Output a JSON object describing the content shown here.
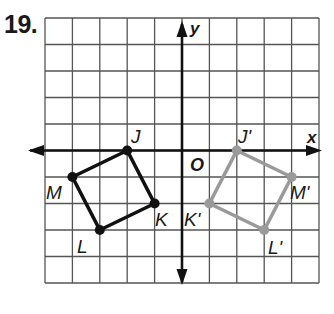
{
  "problem": {
    "number": "19."
  },
  "grid": {
    "cols": 10,
    "rows": 10,
    "x_range": [
      -5,
      5
    ],
    "y_range": [
      -5,
      5
    ],
    "origin_px": [
      182,
      150.5
    ],
    "cell_w": 27.4,
    "cell_h": 26.5,
    "left": 45,
    "top": 18,
    "grid_color": "#555555",
    "axis_color": "#111111"
  },
  "axes": {
    "x_label": "x",
    "y_label": "y",
    "origin_label": "O"
  },
  "shapes": {
    "original": {
      "color": "#111111",
      "vertices": [
        {
          "name": "J",
          "label": "J",
          "x": -2,
          "y": 0
        },
        {
          "name": "K",
          "label": "K",
          "x": -1,
          "y": -2
        },
        {
          "name": "L",
          "label": "L",
          "x": -3,
          "y": -3
        },
        {
          "name": "M",
          "label": "M",
          "x": -4,
          "y": -1
        }
      ]
    },
    "image": {
      "color": "#9a9a9a",
      "vertices": [
        {
          "name": "J'",
          "label": "J'",
          "x": 2,
          "y": 0
        },
        {
          "name": "K'",
          "label": "K'",
          "x": 1,
          "y": -2
        },
        {
          "name": "L'",
          "label": "L'",
          "x": 3,
          "y": -3
        },
        {
          "name": "M'",
          "label": "M'",
          "x": 4,
          "y": -1
        }
      ]
    }
  }
}
